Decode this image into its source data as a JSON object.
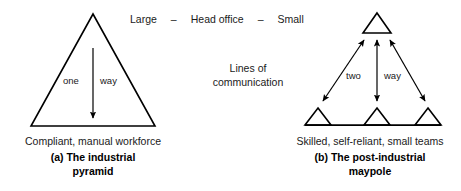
{
  "figure": {
    "header": {
      "left_label": "Large",
      "separator_1": "–",
      "center_label": "Head office",
      "separator_2": "–",
      "right_label": "Small"
    },
    "center_note": {
      "line1": "Lines of",
      "line2": "communication"
    },
    "left_panel": {
      "flow_label_left": "one",
      "flow_label_right": "way",
      "description": "Compliant, manual workforce",
      "caption_line1": "(a) The industrial",
      "caption_line2": "pyramid"
    },
    "right_panel": {
      "flow_label_left": "two",
      "flow_label_right": "way",
      "description": "Skilled, self-reliant, small teams",
      "caption_line1": "(b) The post-industrial",
      "caption_line2": "maypole"
    },
    "colors": {
      "stroke": "#000000",
      "text": "#1a1a1a",
      "background": "#ffffff"
    }
  }
}
